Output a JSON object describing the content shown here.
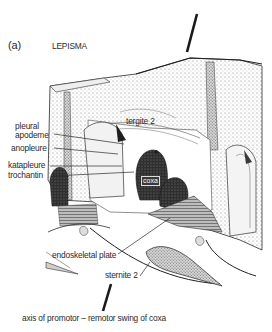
{
  "figure": {
    "panel_label": "(a)",
    "title": "LEPISMA",
    "labels": {
      "pleural_apodeme_line1": "pleural",
      "pleural_apodeme_line2": "apodeme",
      "anopleure": "anopleure",
      "katapleure": "katapleure",
      "trochantin": "trochantin",
      "tergite": "tergite 2",
      "coxa": "coxa",
      "endoskeletal_plate": "endoskeletal plate",
      "sternite": "sternite 2",
      "axis_caption": "axis of promotor – remotor swing of coxa"
    },
    "colors": {
      "ink": "#2b2b2b",
      "stipple": "#8a8a8a",
      "dark_fill": "#2f2f2f",
      "background": "#ffffff"
    }
  }
}
